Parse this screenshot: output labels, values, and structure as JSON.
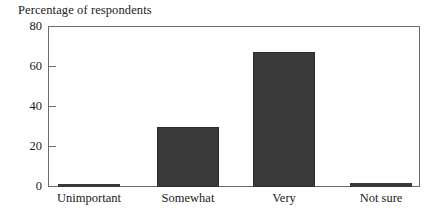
{
  "chart_data": {
    "type": "bar",
    "title": "Percentage of respondents",
    "xlabel": "",
    "ylabel": "",
    "categories": [
      "Unimportant",
      "Somewhat",
      "Very",
      "Not sure"
    ],
    "values": [
      1,
      30,
      67,
      2
    ],
    "ylim": [
      0,
      80
    ],
    "yticks": [
      0,
      20,
      40,
      60,
      80
    ],
    "ytick_labels": [
      "0",
      "20",
      "40",
      "60",
      "80"
    ],
    "grid": false,
    "legend": false,
    "legend_position": "none",
    "bar_color": "#3a3a3a",
    "frame_color": "#6b6b6b",
    "background_color": "#ffffff"
  },
  "figure": {
    "title": "Percentage of respondents"
  },
  "axes": {
    "y": {
      "ticks": [
        {
          "label": "80",
          "value": 80
        },
        {
          "label": "60",
          "value": 60
        },
        {
          "label": "40",
          "value": 40
        },
        {
          "label": "20",
          "value": 20
        },
        {
          "label": "0",
          "value": 0
        }
      ]
    },
    "x": {
      "ticks": [
        {
          "label": "Unimportant"
        },
        {
          "label": "Somewhat"
        },
        {
          "label": "Very"
        },
        {
          "label": "Not sure"
        }
      ]
    }
  }
}
